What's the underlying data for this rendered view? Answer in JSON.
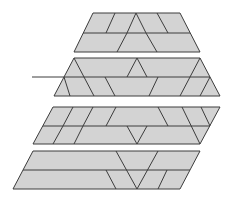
{
  "diagram": {
    "title": "",
    "fill_color": "#d3d3d3",
    "stroke_color": "#3c3c3c",
    "figures": [
      {
        "id": "trapezoid-top",
        "outline": [
          [
            93,
            13
          ],
          [
            180,
            13
          ],
          [
            200,
            52
          ],
          [
            74,
            52
          ]
        ],
        "segments": [
          [
            [
              83,
              33
            ],
            [
              190,
              33
            ]
          ],
          [
            [
              115,
              13
            ],
            [
              106,
              33
            ]
          ],
          [
            [
              136,
              13
            ],
            [
              127,
              33
            ]
          ],
          [
            [
              127,
              33
            ],
            [
              117,
              52
            ]
          ],
          [
            [
              136,
              13
            ],
            [
              146,
              33
            ]
          ],
          [
            [
              146,
              33
            ],
            [
              157,
              52
            ]
          ],
          [
            [
              157,
              13
            ],
            [
              168,
              33
            ]
          ]
        ]
      },
      {
        "id": "trapezoid-second",
        "outline": [
          [
            74,
            58
          ],
          [
            200,
            58
          ],
          [
            220,
            96
          ],
          [
            54,
            96
          ]
        ],
        "segments": [
          [
            [
              64,
              77
            ],
            [
              210,
              77
            ]
          ],
          [
            [
              74,
              58
            ],
            [
              84,
              77
            ]
          ],
          [
            [
              84,
              77
            ],
            [
              94,
              96
            ]
          ],
          [
            [
              64,
              77
            ],
            [
              70,
              96
            ]
          ],
          [
            [
              137,
              58
            ],
            [
              127,
              77
            ]
          ],
          [
            [
              137,
              58
            ],
            [
              147,
              77
            ]
          ],
          [
            [
              105,
              77
            ],
            [
              115,
              96
            ]
          ],
          [
            [
              158,
              77
            ],
            [
              149,
              96
            ]
          ],
          [
            [
              200,
              58
            ],
            [
              190,
              77
            ]
          ],
          [
            [
              190,
              77
            ],
            [
              180,
              96
            ]
          ],
          [
            [
              210,
              77
            ],
            [
              200,
              96
            ]
          ]
        ]
      },
      {
        "id": "parallelogram-third",
        "outline": [
          [
            53,
            107
          ],
          [
            220,
            107
          ],
          [
            200,
            144
          ],
          [
            33,
            144
          ]
        ],
        "segments": [
          [
            [
              43,
              126
            ],
            [
              210,
              126
            ]
          ],
          [
            [
              73,
              107
            ],
            [
              63,
              126
            ]
          ],
          [
            [
              63,
              126
            ],
            [
              53,
              144
            ]
          ],
          [
            [
              93,
              107
            ],
            [
              83,
              126
            ]
          ],
          [
            [
              83,
              126
            ],
            [
              74,
              144
            ]
          ],
          [
            [
              116,
              107
            ],
            [
              106,
              126
            ]
          ],
          [
            [
              158,
              107
            ],
            [
              168,
              126
            ]
          ],
          [
            [
              182,
              107
            ],
            [
              200,
              144
            ]
          ],
          [
            [
              201,
              107
            ],
            [
              210,
              126
            ]
          ],
          [
            [
              127,
              126
            ],
            [
              137,
              144
            ]
          ],
          [
            [
              147,
              126
            ],
            [
              137,
              144
            ]
          ]
        ]
      },
      {
        "id": "parallelogram-bottom",
        "outline": [
          [
            33,
            151
          ],
          [
            200,
            151
          ],
          [
            180,
            189
          ],
          [
            13,
            189
          ]
        ],
        "segments": [
          [
            [
              23,
              170
            ],
            [
              190,
              170
            ]
          ],
          [
            [
              116,
              151
            ],
            [
              137,
              189
            ]
          ],
          [
            [
              158,
              151
            ],
            [
              137,
              189
            ]
          ],
          [
            [
              106,
              170
            ],
            [
              116,
              189
            ]
          ],
          [
            [
              167,
              170
            ],
            [
              158,
              189
            ]
          ]
        ]
      }
    ],
    "pointer_line": [
      [
        32,
        77
      ],
      [
        64,
        77
      ]
    ]
  }
}
